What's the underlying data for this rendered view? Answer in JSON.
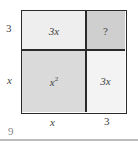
{
  "diagram": {
    "type": "area-model",
    "cells": {
      "top_left": "3x",
      "top_right": "?",
      "bottom_left_base": "x",
      "bottom_left_exp": "2",
      "bottom_right": "3x"
    },
    "side_labels": {
      "left_top": "3",
      "left_bottom": "x",
      "bottom_left": "x",
      "bottom_right": "3"
    },
    "page_number": "9",
    "colors": {
      "top_left": "#eeeeee",
      "top_right": "#cfcfcf",
      "bottom_left": "#dadada",
      "bottom_right": "#f3f3f3",
      "border": "#2a2a2a"
    }
  }
}
